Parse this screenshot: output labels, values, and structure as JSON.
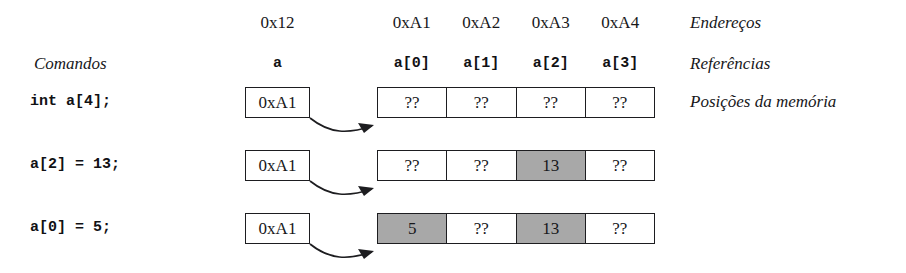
{
  "diagram": {
    "column_headers": {
      "pointer_address": "0x12",
      "cell_addresses": [
        "0xA1",
        "0xA2",
        "0xA3",
        "0xA4"
      ]
    },
    "reference_row": {
      "pointer_name": "a",
      "cell_names": [
        "a[0]",
        "a[1]",
        "a[2]",
        "a[3]"
      ]
    },
    "left_header": "Comandos",
    "side_labels": {
      "addresses": "Endereços",
      "references": "Referências",
      "memory_positions": "Posições da memória"
    },
    "colors": {
      "stroke": "#1d1d20",
      "filled_cell": "#a8a8a8",
      "background": "#ffffff",
      "text": "#17171a"
    },
    "rows": [
      {
        "command": "int a[4];",
        "pointer_value": "0xA1",
        "cells": [
          {
            "value": "??",
            "filled": false
          },
          {
            "value": "??",
            "filled": false
          },
          {
            "value": "??",
            "filled": false
          },
          {
            "value": "??",
            "filled": false
          }
        ]
      },
      {
        "command": "a[2] = 13;",
        "pointer_value": "0xA1",
        "cells": [
          {
            "value": "??",
            "filled": false
          },
          {
            "value": "??",
            "filled": false
          },
          {
            "value": "13",
            "filled": true
          },
          {
            "value": "??",
            "filled": false
          }
        ]
      },
      {
        "command": "a[0] = 5;",
        "pointer_value": "0xA1",
        "cells": [
          {
            "value": "5",
            "filled": true
          },
          {
            "value": "??",
            "filled": false
          },
          {
            "value": "13",
            "filled": true
          },
          {
            "value": "??",
            "filled": false
          }
        ]
      }
    ]
  }
}
